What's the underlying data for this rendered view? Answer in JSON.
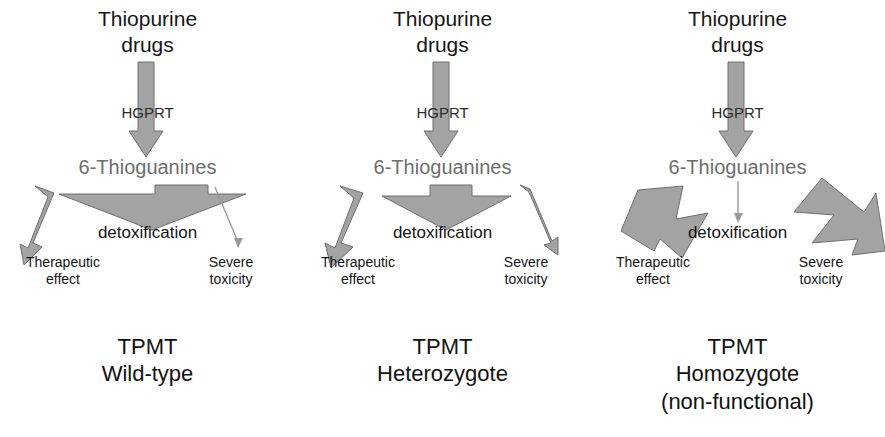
{
  "figure": {
    "type": "diagram",
    "panel_width": 295,
    "panel_count": 3,
    "colors": {
      "arrow_fill": "#a3a3a3",
      "arrow_stroke": "#6f6f6f",
      "thin_line": "#9a9a9a",
      "text_black": "#141414",
      "text_gray": "#6d6d6d",
      "background": "#ffffff"
    }
  },
  "shared": {
    "drug_label": "Thiopurine\ndrugs",
    "enzyme_label": "HGPRT",
    "metabolite_label": "6-Thioguanines",
    "detox_label": "detoxification",
    "outcome_left": "Therapeutic\neffect",
    "outcome_right": "Severe\ntoxicity"
  },
  "panels": [
    {
      "id": "wild-type",
      "footer": "TPMT\nWild-type",
      "hgprt_arrow": {
        "magnitude": "medium",
        "points": "138,62 154,62 154,131 163,131 146,157 129,131 138,131"
      },
      "therapeutic_arrow": {
        "magnitude": "small",
        "points": "35,186 54,193 33,243 42,247 24,265 20,244 28,248 48,197"
      },
      "detox_arrow": {
        "magnitude": "large",
        "points": "59,194 155,194 155,185 208,185 208,194 246,194 152,230"
      },
      "toxicity_arrow": {
        "magnitude": "trace",
        "shape": "thin-line",
        "line": {
          "x1": 215,
          "y1": 187,
          "x2": 238,
          "y2": 242
        },
        "head": "238,248 234,238 243,238"
      }
    },
    {
      "id": "heterozygote",
      "footer": "TPMT\nHeterozygote",
      "hgprt_arrow": {
        "magnitude": "medium",
        "points": "138,62 154,62 154,131 163,131 146,157 129,131 138,131"
      },
      "therapeutic_arrow": {
        "magnitude": "medium",
        "points": "45,186 68,193 46,243 58,247 36,268 30,243 40,248 59,198"
      },
      "detox_arrow": {
        "magnitude": "medium",
        "points": "87,196 135,196 135,185 177,185 177,196 216,196 151,230"
      },
      "toxicity_arrow": {
        "magnitude": "small",
        "shape": "thin-arrow",
        "points": "225,185 235,189 257,241 263,237 263,255 249,245 256,243 234,192"
      }
    },
    {
      "id": "homozygote",
      "footer": "TPMT\nHomozygote\n(non-functional)",
      "hgprt_arrow": {
        "magnitude": "medium",
        "points": "138,62 154,62 154,131 163,131 146,157 129,131 138,131"
      },
      "therapeutic_arrow": {
        "magnitude": "large",
        "points": "48,190 93,186 86,219 118,213 92,258 70,239 64,251 31,231"
      },
      "detox_arrow": {
        "magnitude": "trace",
        "shape": "thin-line",
        "line": {
          "x1": 148,
          "y1": 181,
          "x2": 148,
          "y2": 217
        },
        "head": "148,223 144,213 153,213"
      },
      "toxicity_arrow": {
        "magnitude": "large",
        "points": "232,178 274,212 286,193 295,251 262,255 268,239 222,243 244,215 204,212"
      }
    }
  ]
}
